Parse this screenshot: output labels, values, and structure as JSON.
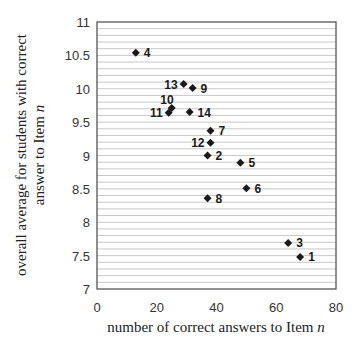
{
  "chart_data": {
    "type": "scatter",
    "title": "",
    "xlabel": "number of correct answers to Item n",
    "ylabel_lines": [
      "overall average for students with correct",
      "answer to Item n"
    ],
    "xlim": [
      0,
      80
    ],
    "ylim": [
      7,
      11
    ],
    "x_ticks": [
      0,
      20,
      40,
      60,
      80
    ],
    "x_tick_labels": [
      "0",
      "20",
      "40",
      "60",
      "80"
    ],
    "y_ticks": [
      7,
      7.5,
      8,
      8.5,
      9,
      9.5,
      10,
      10.5,
      11
    ],
    "y_tick_labels": [
      "7",
      "7.5",
      "8",
      "8.5",
      "9",
      "9.5",
      "10",
      "10.5",
      "11"
    ],
    "grid": {
      "horizontal": true,
      "vertical": false,
      "minor_step": 0.1
    },
    "legend": null,
    "marker": "diamond",
    "points": [
      {
        "label": "1",
        "x": 68,
        "y": 7.48,
        "label_pos": "right"
      },
      {
        "label": "2",
        "x": 37,
        "y": 9.0,
        "label_pos": "right"
      },
      {
        "label": "3",
        "x": 64,
        "y": 7.69,
        "label_pos": "right"
      },
      {
        "label": "4",
        "x": 13,
        "y": 10.54,
        "label_pos": "right"
      },
      {
        "label": "5",
        "x": 48,
        "y": 8.89,
        "label_pos": "right"
      },
      {
        "label": "6",
        "x": 50,
        "y": 8.51,
        "label_pos": "right"
      },
      {
        "label": "7",
        "x": 38,
        "y": 9.37,
        "label_pos": "right"
      },
      {
        "label": "8",
        "x": 37,
        "y": 8.36,
        "label_pos": "right"
      },
      {
        "label": "9",
        "x": 32,
        "y": 10.01,
        "label_pos": "right"
      },
      {
        "label": "10",
        "x": 25,
        "y": 9.71,
        "label_pos": "above-left"
      },
      {
        "label": "11",
        "x": 24,
        "y": 9.64,
        "label_pos": "left"
      },
      {
        "label": "12",
        "x": 38,
        "y": 9.19,
        "label_pos": "left"
      },
      {
        "label": "13",
        "x": 29,
        "y": 10.07,
        "label_pos": "left"
      },
      {
        "label": "14",
        "x": 31,
        "y": 9.65,
        "label_pos": "right"
      }
    ]
  },
  "colors": {
    "marker": "#1a1a1a",
    "grid": "#c8c8c8",
    "frame": "#555555"
  }
}
